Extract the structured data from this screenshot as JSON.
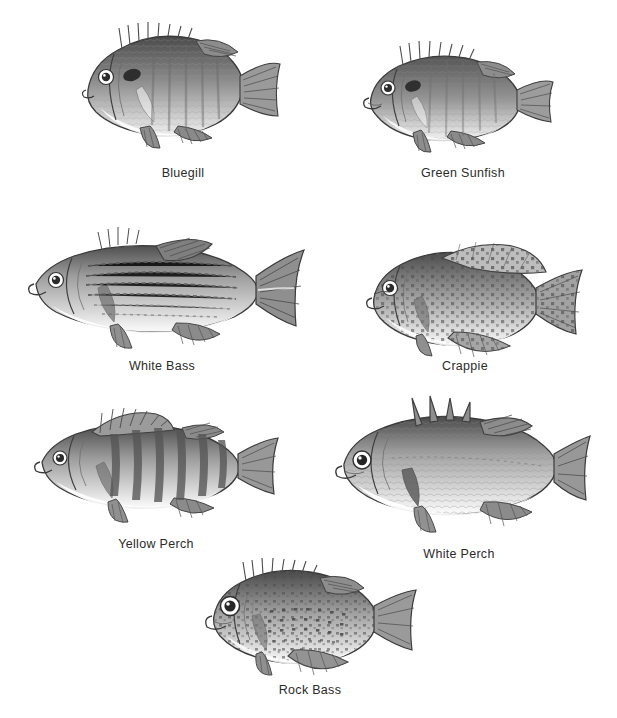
{
  "plate": {
    "background_color": "#ffffff",
    "ink_color": "#3a3a3a",
    "label_color": "#2b2b2b",
    "medium": "pencil illustration",
    "subject": "freshwater panfish species plate"
  },
  "figures": [
    {
      "id": "bluegill",
      "label": "Bluegill",
      "row": 1,
      "body_shape": "deep oval",
      "features": "dark opercular flap, vertical bars, long spiny dorsal fin",
      "x": 70,
      "y": 20,
      "w": 215,
      "h": 130,
      "label_x": 183,
      "label_y": 173
    },
    {
      "id": "green-sunfish",
      "label": "Green Sunfish",
      "row": 1,
      "body_shape": "elongated oval",
      "features": "large mouth, mottled flanks, rounded fins",
      "x": 355,
      "y": 40,
      "w": 205,
      "h": 118,
      "label_x": 463,
      "label_y": 173
    },
    {
      "id": "white-bass",
      "label": "White Bass",
      "row": 2,
      "body_shape": "streamlined elongated",
      "features": "horizontal dark stripes, deeply forked tail, two dorsal fins",
      "x": 22,
      "y": 222,
      "w": 290,
      "h": 130,
      "label_x": 162,
      "label_y": 366
    },
    {
      "id": "crappie",
      "label": "Crappie",
      "row": 2,
      "body_shape": "deep compressed",
      "features": "speckled mottling, large soft dorsal fin",
      "x": 360,
      "y": 238,
      "w": 230,
      "h": 125,
      "label_x": 465,
      "label_y": 366
    },
    {
      "id": "yellow-perch",
      "label": "Yellow Perch",
      "row": 3,
      "body_shape": "elongated",
      "features": "six to eight dark vertical bars, two separate dorsal fins",
      "x": 30,
      "y": 400,
      "w": 255,
      "h": 125,
      "label_x": 156,
      "label_y": 544
    },
    {
      "id": "white-perch",
      "label": "White Perch",
      "row": 3,
      "body_shape": "deep bodied",
      "features": "fine scale texture, high spiny dorsal, large eye",
      "x": 330,
      "y": 396,
      "w": 262,
      "h": 140,
      "label_x": 459,
      "label_y": 554
    },
    {
      "id": "rock-bass",
      "label": "Rock Bass",
      "row": 4,
      "body_shape": "deep oval",
      "features": "large red eye, rows of dark spots along scale rows",
      "x": 200,
      "y": 558,
      "w": 225,
      "h": 120,
      "label_x": 310,
      "label_y": 690
    }
  ]
}
